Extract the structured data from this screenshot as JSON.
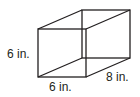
{
  "figure": {
    "shape": "rectangular-prism",
    "labels": {
      "height": "6 in.",
      "width": "6 in.",
      "depth": "8 in."
    },
    "stroke_color": "#231f20"
  }
}
